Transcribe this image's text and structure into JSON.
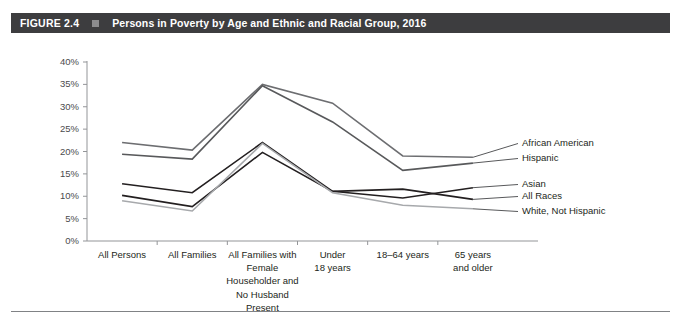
{
  "figure": {
    "number_label": "FIGURE 2.4",
    "title": "Persons in Poverty by Age and Ethnic and Racial Group, 2016",
    "square_icon": "square-bullet-icon",
    "bar_color": "#3d3d3f",
    "bar_text_color": "#ffffff"
  },
  "chart_data": {
    "type": "line",
    "title": "Persons in Poverty by Age and Ethnic and Racial Group, 2016",
    "xlabel": "",
    "ylabel": "",
    "ylim": [
      0,
      40
    ],
    "ytick_step": 5,
    "grid": false,
    "legend_position": "right-inline",
    "ytick_labels": [
      "0%",
      "5%",
      "10%",
      "15%",
      "20%",
      "25%",
      "30%",
      "35%",
      "40%"
    ],
    "ytick_values": [
      0,
      5,
      10,
      15,
      20,
      25,
      30,
      35,
      40
    ],
    "categories": [
      "All Persons",
      "All Families",
      "All Families with Female Householder and No Husband Present",
      "Under 18 years",
      "18–64 years",
      "65 years and older"
    ],
    "category_label_lines": [
      [
        "All Persons"
      ],
      [
        "All Families"
      ],
      [
        "All Families with",
        "Female",
        "Householder and",
        "No Husband",
        "Present"
      ],
      [
        "Under",
        "18 years"
      ],
      [
        "18–64 years"
      ],
      [
        "65 years",
        "and older"
      ]
    ],
    "series": [
      {
        "name": "African American",
        "color": "#6d6e71",
        "values": [
          22.0,
          20.3,
          35.0,
          30.8,
          19.0,
          18.7
        ]
      },
      {
        "name": "Hispanic",
        "color": "#58595b",
        "values": [
          19.4,
          18.3,
          34.7,
          26.6,
          15.8,
          17.4
        ]
      },
      {
        "name": "Asian",
        "color": "#231f20",
        "values": [
          12.8,
          10.8,
          22.0,
          11.1,
          9.6,
          11.9
        ]
      },
      {
        "name": "All Races",
        "color": "#231f20",
        "values": [
          10.2,
          7.7,
          19.8,
          11.1,
          11.6,
          9.3
        ]
      },
      {
        "name": "White, Not Hispanic",
        "color": "#a7a9ac",
        "values": [
          9.0,
          6.7,
          21.8,
          10.8,
          8.0,
          7.2
        ]
      }
    ],
    "series_labels": [
      "African American",
      "Hispanic",
      "Asian",
      "All Races",
      "White, Not Hispanic"
    ]
  }
}
